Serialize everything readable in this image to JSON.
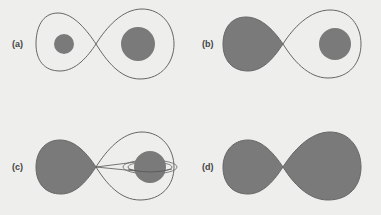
{
  "figure": {
    "panels": [
      {
        "id": "a",
        "label": "(a)",
        "description": "Detached binary: both stars well inside their Roche lobes"
      },
      {
        "id": "b",
        "label": "(b)",
        "description": "Semi-detached binary: left star fills its Roche lobe"
      },
      {
        "id": "c",
        "label": "(c)",
        "description": "Mass transfer through inner Lagrange point onto an accretion disk around the companion"
      },
      {
        "id": "d",
        "label": "(d)",
        "description": "Contact binary: both stars fill their Roche lobes"
      }
    ],
    "colors": {
      "background": "#eeeeec",
      "star_fill": "#7a7a7a",
      "lobe_outline": "#666666",
      "label": "#444444"
    }
  }
}
